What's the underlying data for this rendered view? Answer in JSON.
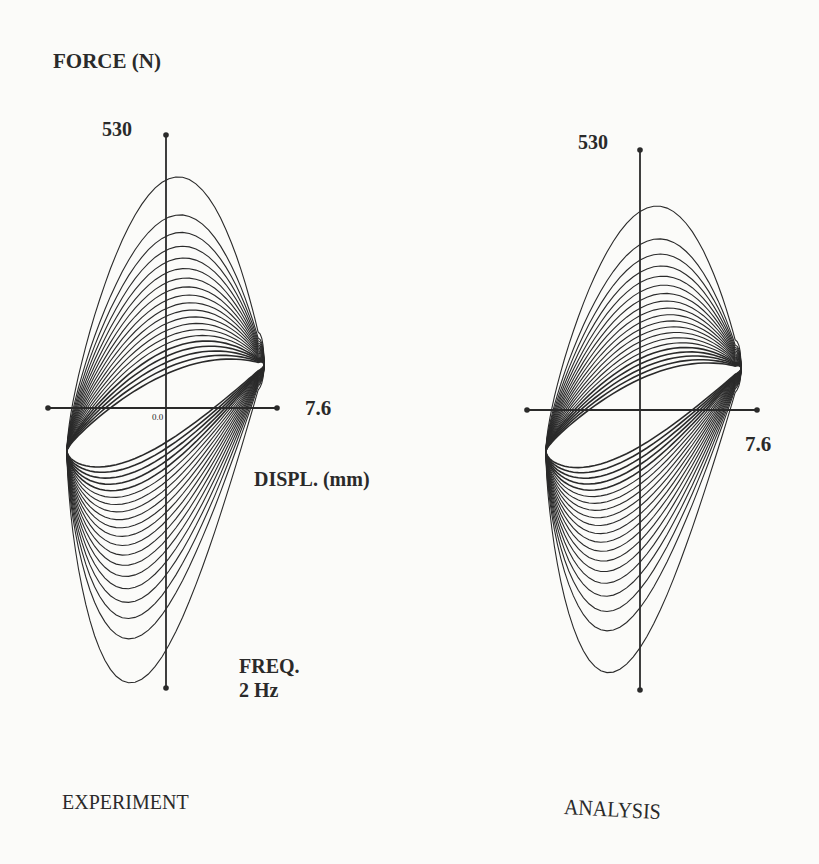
{
  "figure": {
    "y_axis_label": "FORCE (N)",
    "x_axis_label": "DISPL. (mm)",
    "frequency_label": "FREQ.",
    "frequency_value": "2 Hz",
    "origin_label": "0.0",
    "panels": [
      {
        "id": "experiment",
        "title": "EXPERIMENT",
        "y_max_label": "530",
        "x_max_label": "7.6"
      },
      {
        "id": "analysis",
        "title": "ANALYSIS",
        "y_max_label": "530",
        "x_max_label": "7.6"
      }
    ],
    "colors": {
      "ink": "#2a2a2a",
      "background": "#fbfbf9"
    }
  },
  "chart_data": [
    {
      "type": "line",
      "title": "EXPERIMENT",
      "subtitle": "FREQ. 2 Hz",
      "xlabel": "DISPL. (mm)",
      "ylabel": "FORCE (N)",
      "xlim": [
        -7.6,
        7.6
      ],
      "ylim": [
        -530,
        530
      ],
      "description": "Family of force-displacement hysteresis loops (approx. 20 cycles) decaying from the initial large loop to a steady-state ellipse",
      "series": [
        {
          "name": "first cycle peak",
          "x": [
            6.2
          ],
          "y": [
            540
          ]
        },
        {
          "name": "steady-state loop",
          "x": [
            -5.9,
            5.2,
            6.6,
            -6.6
          ],
          "y": [
            0,
            0,
            145,
            -145
          ]
        },
        {
          "name": "outermost loop min",
          "x": [
            -4.5
          ],
          "y": [
            -545
          ]
        }
      ],
      "loop_count_estimate": 20,
      "steady_state_force_amplitude_N": 150,
      "displacement_amplitude_mm": 6.6,
      "grid": false,
      "legend": null
    },
    {
      "type": "line",
      "title": "ANALYSIS",
      "subtitle": "FREQ. 2 Hz",
      "xlabel": "DISPL. (mm)",
      "ylabel": "FORCE (N)",
      "xlim": [
        -7.6,
        7.6
      ],
      "ylim": [
        -530,
        530
      ],
      "description": "Computed family of force-displacement hysteresis loops (approx. 20 cycles) converging to a steady-state ellipse",
      "series": [
        {
          "name": "first cycle peak",
          "x": [
            5.0
          ],
          "y": [
            490
          ]
        },
        {
          "name": "steady-state loop",
          "x": [
            -5.8,
            5.2,
            6.6,
            -6.6
          ],
          "y": [
            0,
            0,
            140,
            -140
          ]
        },
        {
          "name": "outermost loop min",
          "x": [
            -4.2
          ],
          "y": [
            -545
          ]
        }
      ],
      "loop_count_estimate": 20,
      "steady_state_force_amplitude_N": 145,
      "displacement_amplitude_mm": 6.6,
      "grid": false,
      "legend": null
    }
  ],
  "render": {
    "panels": [
      {
        "cx": 166,
        "cy": 408,
        "yTop": 135,
        "yBot": 688,
        "xLeft": 48,
        "xRight": 277,
        "loopLeft": 67,
        "loopRight": 264,
        "ssTop": 330,
        "ssBot": 487,
        "peakTop": 128,
        "peakBot": 704,
        "loops": 20
      },
      {
        "cx": 640,
        "cy": 410,
        "yTop": 150,
        "yBot": 690,
        "xLeft": 527,
        "xRight": 757,
        "loopLeft": 546,
        "loopRight": 741,
        "ssTop": 335,
        "ssBot": 487,
        "peakTop": 160,
        "peakBot": 693,
        "loops": 20
      }
    ]
  }
}
